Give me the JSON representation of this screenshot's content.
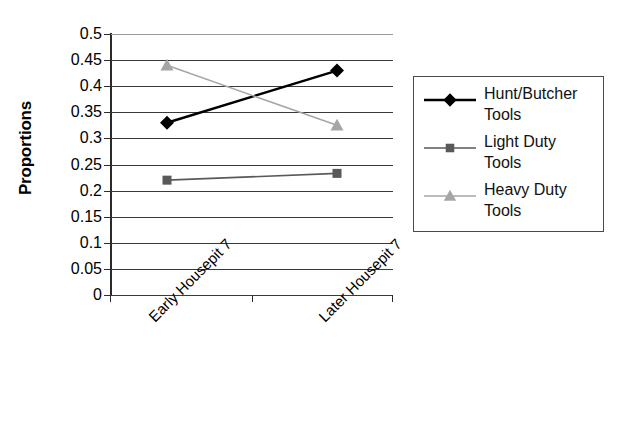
{
  "chart_data": {
    "type": "line",
    "title": "",
    "xlabel": "",
    "ylabel": "Proportions",
    "categories": [
      "Early Housepit 7",
      "Later Housepit 7"
    ],
    "ylim": [
      0,
      0.5
    ],
    "y_ticks": [
      "0",
      "0.05",
      "0.1",
      "0.15",
      "0.2",
      "0.25",
      "0.3",
      "0.35",
      "0.4",
      "0.45",
      "0.5"
    ],
    "grid": true,
    "legend_position": "right",
    "series": [
      {
        "name": "Hunt/Butcher Tools",
        "marker": "diamond",
        "color": "#000000",
        "values": [
          0.33,
          0.43
        ]
      },
      {
        "name": "Light Duty Tools",
        "marker": "square",
        "color": "#595959",
        "values": [
          0.22,
          0.233
        ]
      },
      {
        "name": "Heavy Duty Tools",
        "marker": "triangle",
        "color": "#a6a6a6",
        "values": [
          0.44,
          0.325
        ]
      }
    ]
  },
  "axes": {
    "y_title": "Proportions",
    "y_tick_labels": [
      "0.5",
      "0.45",
      "0.4",
      "0.35",
      "0.3",
      "0.25",
      "0.2",
      "0.15",
      "0.1",
      "0.05",
      "0"
    ],
    "x_tick_labels": [
      "Early Housepit 7",
      "Later Housepit 7"
    ]
  },
  "legend": {
    "entries": [
      {
        "label_line1": "Hunt/Butcher",
        "label_line2": "Tools",
        "color": "#000000",
        "marker": "diamond"
      },
      {
        "label_line1": "Light Duty",
        "label_line2": "Tools",
        "color": "#595959",
        "marker": "square"
      },
      {
        "label_line1": "Heavy Duty",
        "label_line2": "Tools",
        "color": "#a6a6a6",
        "marker": "triangle"
      }
    ]
  }
}
